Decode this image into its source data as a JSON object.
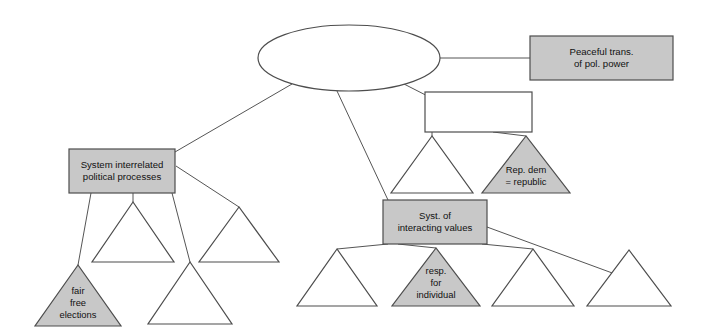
{
  "diagram": {
    "type": "concept-map",
    "title": "",
    "background_color": "#ffffff",
    "style": {
      "fill_gray": "#c8c8c8",
      "fill_white": "#ffffff",
      "stroke": "#4d4d4d",
      "edge_stroke": "#555555",
      "text_color": "#111111"
    },
    "nodes": [
      {
        "id": "central-ellipse",
        "name": "central-ellipse-node",
        "shape": "ellipse",
        "fill": "white",
        "cx": 349,
        "cy": 58,
        "rx": 91,
        "ry": 33,
        "lines": []
      },
      {
        "id": "peaceful-transition",
        "name": "peaceful-transition-box",
        "shape": "rect",
        "fill": "gray",
        "x": 530,
        "y": 36,
        "width": 143,
        "height": 44,
        "lines": [
          "Peaceful trans.",
          "of pol. power"
        ]
      },
      {
        "id": "empty-rect",
        "name": "empty-rectangle-node",
        "shape": "rect",
        "fill": "white",
        "x": 425,
        "y": 92,
        "width": 107,
        "height": 40,
        "lines": []
      },
      {
        "id": "system-interrelated",
        "name": "system-interrelated-box",
        "shape": "rect",
        "fill": "gray",
        "x": 69,
        "y": 149,
        "width": 106,
        "height": 44,
        "lines": [
          "System interrelated",
          "political processes"
        ]
      },
      {
        "id": "syst-interacting-values",
        "name": "syst-interacting-values-box",
        "shape": "rect",
        "fill": "gray",
        "x": 383,
        "y": 200,
        "width": 104,
        "height": 44,
        "lines": [
          "Syst. of",
          "interacting values"
        ]
      },
      {
        "id": "tri-under-rect",
        "name": "unlabeled-triangle-under-rectangle",
        "shape": "triangle",
        "fill": "white",
        "apex_x": 432,
        "apex_y": 136,
        "base_y": 193,
        "half_width": 41,
        "lines": []
      },
      {
        "id": "rep-dem-republic",
        "name": "rep-dem-republic-triangle",
        "shape": "triangle",
        "fill": "gray",
        "apex_x": 526,
        "apex_y": 136,
        "base_y": 193,
        "half_width": 44,
        "lines": [
          "Rep. dem",
          "= republic"
        ]
      },
      {
        "id": "tri-left-upper",
        "name": "unlabeled-triangle-left-upper",
        "shape": "triangle",
        "fill": "white",
        "apex_x": 133,
        "apex_y": 202,
        "base_y": 262,
        "half_width": 41,
        "lines": []
      },
      {
        "id": "tri-left-mid",
        "name": "unlabeled-triangle-left-middle",
        "shape": "triangle",
        "fill": "white",
        "apex_x": 239,
        "apex_y": 207,
        "base_y": 262,
        "half_width": 40,
        "lines": []
      },
      {
        "id": "tri-left-lower",
        "name": "unlabeled-triangle-left-lower",
        "shape": "triangle",
        "fill": "white",
        "apex_x": 190,
        "apex_y": 262,
        "base_y": 324,
        "half_width": 42,
        "lines": []
      },
      {
        "id": "fair-free-elections",
        "name": "fair-free-elections-triangle",
        "shape": "triangle",
        "fill": "gray",
        "apex_x": 78,
        "apex_y": 265,
        "base_y": 326,
        "half_width": 43,
        "lines": [
          "fair",
          "free",
          "elections"
        ]
      },
      {
        "id": "tri-bottom-1",
        "name": "unlabeled-triangle-bottom-first",
        "shape": "triangle",
        "fill": "white",
        "apex_x": 337,
        "apex_y": 249,
        "base_y": 306,
        "half_width": 40,
        "lines": []
      },
      {
        "id": "resp-for-individual",
        "name": "resp-for-individual-triangle",
        "shape": "triangle",
        "fill": "gray",
        "apex_x": 436,
        "apex_y": 248,
        "base_y": 306,
        "half_width": 44,
        "lines": [
          "resp.",
          "for",
          "individual"
        ]
      },
      {
        "id": "tri-bottom-3",
        "name": "unlabeled-triangle-bottom-third",
        "shape": "triangle",
        "fill": "white",
        "apex_x": 533,
        "apex_y": 249,
        "base_y": 306,
        "half_width": 41,
        "lines": []
      },
      {
        "id": "tri-bottom-4",
        "name": "unlabeled-triangle-bottom-fourth",
        "shape": "triangle",
        "fill": "white",
        "apex_x": 629,
        "apex_y": 250,
        "base_y": 306,
        "half_width": 42,
        "lines": []
      }
    ],
    "edges": [
      {
        "name": "edge-ellipse-to-peaceful-transition",
        "from": "central-ellipse",
        "to": "peaceful-transition",
        "x1": 440,
        "y1": 58,
        "x2": 530,
        "y2": 58
      },
      {
        "name": "edge-ellipse-to-empty-rect",
        "from": "central-ellipse",
        "to": "empty-rect",
        "x1": 404,
        "y1": 84,
        "x2": 455,
        "y2": 110
      },
      {
        "name": "edge-ellipse-to-system-interrelated",
        "from": "central-ellipse",
        "to": "system-interrelated",
        "x1": 292,
        "y1": 84,
        "x2": 175,
        "y2": 152
      },
      {
        "name": "edge-ellipse-to-syst-interacting-values",
        "from": "central-ellipse",
        "to": "syst-interacting-values",
        "x1": 337,
        "y1": 91,
        "x2": 388,
        "y2": 200
      },
      {
        "name": "edge-empty-rect-to-rep-dem",
        "from": "empty-rect",
        "to": "rep-dem-republic",
        "x1": 493,
        "y1": 132,
        "x2": 526,
        "y2": 136
      },
      {
        "name": "edge-empty-rect-to-tri-under-rect",
        "from": "empty-rect",
        "to": "tri-under-rect",
        "x1": 432,
        "y1": 132,
        "x2": 432,
        "y2": 136
      },
      {
        "name": "edge-system-to-fair-free-elections",
        "from": "system-interrelated",
        "to": "fair-free-elections",
        "x1": 91,
        "y1": 193,
        "x2": 78,
        "y2": 265
      },
      {
        "name": "edge-system-to-tri-left-upper",
        "from": "system-interrelated",
        "to": "tri-left-upper",
        "x1": 133,
        "y1": 193,
        "x2": 133,
        "y2": 202
      },
      {
        "name": "edge-system-to-tri-left-lower",
        "from": "system-interrelated",
        "to": "tri-left-lower",
        "x1": 172,
        "y1": 193,
        "x2": 190,
        "y2": 262
      },
      {
        "name": "edge-system-to-tri-left-mid",
        "from": "system-interrelated",
        "to": "tri-left-mid",
        "x1": 176,
        "y1": 166,
        "x2": 239,
        "y2": 207
      },
      {
        "name": "edge-values-to-tri-bottom-1",
        "from": "syst-interacting-values",
        "to": "tri-bottom-1",
        "x1": 388,
        "y1": 244,
        "x2": 337,
        "y2": 249
      },
      {
        "name": "edge-values-to-resp-individual",
        "from": "syst-interacting-values",
        "to": "resp-for-individual",
        "x1": 398,
        "y1": 244,
        "x2": 436,
        "y2": 248
      },
      {
        "name": "edge-values-to-tri-bottom-3",
        "from": "syst-interacting-values",
        "to": "tri-bottom-3",
        "x1": 482,
        "y1": 244,
        "x2": 533,
        "y2": 249
      },
      {
        "name": "edge-values-to-tri-bottom-4",
        "from": "syst-interacting-values",
        "to": "tri-bottom-4",
        "x1": 487,
        "y1": 227,
        "x2": 615,
        "y2": 274
      }
    ]
  }
}
